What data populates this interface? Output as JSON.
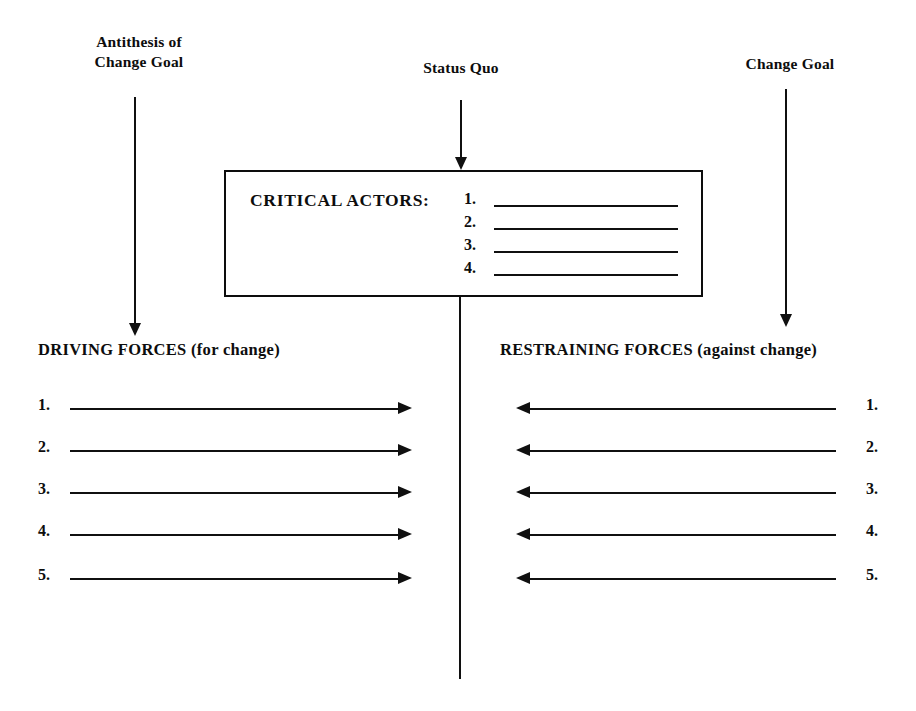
{
  "diagram": {
    "ink_color": "#101010",
    "background_color": "#ffffff"
  },
  "top_labels": {
    "antithesis": "Antithesis of\nChange Goal",
    "status_quo": "Status Quo",
    "change_goal": "Change Goal"
  },
  "critical_actors": {
    "title": "CRITICAL ACTORS:",
    "rows": [
      {
        "number": "1.",
        "value": ""
      },
      {
        "number": "2.",
        "value": ""
      },
      {
        "number": "3.",
        "value": ""
      },
      {
        "number": "4.",
        "value": ""
      }
    ]
  },
  "driving_forces": {
    "header": "DRIVING FORCES (for change)",
    "direction": "right",
    "rows": [
      {
        "number": "1.",
        "value": ""
      },
      {
        "number": "2.",
        "value": ""
      },
      {
        "number": "3.",
        "value": ""
      },
      {
        "number": "4.",
        "value": ""
      },
      {
        "number": "5.",
        "value": ""
      }
    ]
  },
  "restraining_forces": {
    "header": "RESTRAINING FORCES (against change)",
    "direction": "left",
    "rows": [
      {
        "number": "1.",
        "value": ""
      },
      {
        "number": "2.",
        "value": ""
      },
      {
        "number": "3.",
        "value": ""
      },
      {
        "number": "4.",
        "value": ""
      },
      {
        "number": "5.",
        "value": ""
      }
    ]
  }
}
